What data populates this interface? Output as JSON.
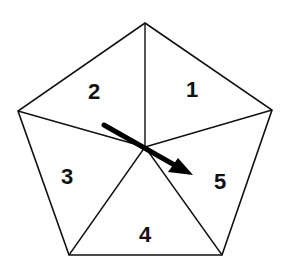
{
  "diagram": {
    "type": "spinner",
    "shape": "regular-pentagon",
    "stroke_color": "#111111",
    "fill_color": "#ffffff",
    "sections": [
      {
        "label": "1",
        "x": 192,
        "y": 90
      },
      {
        "label": "2",
        "x": 94,
        "y": 92
      },
      {
        "label": "3",
        "x": 67,
        "y": 177
      },
      {
        "label": "4",
        "x": 145,
        "y": 235
      },
      {
        "label": "5",
        "x": 220,
        "y": 182
      }
    ],
    "arrow": {
      "pointing_to": "5",
      "color": "#000000"
    }
  }
}
